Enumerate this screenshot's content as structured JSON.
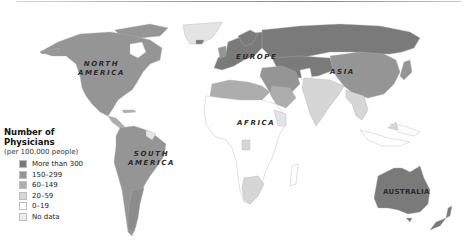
{
  "map": {
    "title_line": true,
    "continent_labels": {
      "north_america": "NORTH\nAMERICA",
      "north_america_line1": "NORTH",
      "north_america_line2": "AMERICA",
      "south_america_line1": "SOUTH",
      "south_america_line2": "AMERICA",
      "europe": "EUROPE",
      "asia": "ASIA",
      "africa": "AFRICA",
      "australia": "AUSTRALIA"
    },
    "colors": {
      "more_than_300": "#7a7a7a",
      "150_299": "#959595",
      "60_149": "#acacac",
      "20_59": "#d4d4d4",
      "0_19": "#ffffff",
      "no_data": "#ececec",
      "border": "#a8a8a8"
    }
  },
  "legend": {
    "title_line1": "Number of",
    "title_line2": "Physicians",
    "subtitle": "(per 100,000 people)",
    "items": [
      {
        "label": "More than 300",
        "color": "#7a7a7a"
      },
      {
        "label": "150–299",
        "color": "#959595"
      },
      {
        "label": "60–149",
        "color": "#adadad"
      },
      {
        "label": "20–59",
        "color": "#d6d6d6"
      },
      {
        "label": "0–19",
        "color": "#ffffff"
      },
      {
        "label": "No data",
        "color": "#ececec"
      }
    ]
  }
}
